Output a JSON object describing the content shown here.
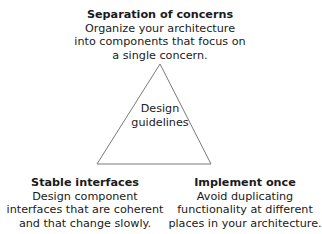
{
  "diagram": {
    "center": {
      "line1": "Design",
      "line2": "guidelines"
    },
    "top": {
      "title": "Separation of concerns",
      "lines": [
        "Organize your architecture",
        "into components that focus on",
        "a single concern."
      ]
    },
    "left": {
      "title": "Stable interfaces",
      "lines": [
        "Design component",
        "interfaces that are coherent",
        "and that change slowly."
      ]
    },
    "right": {
      "title": "Implement once",
      "lines": [
        "Avoid duplicating",
        "functionality at different",
        "places in your architecture."
      ]
    },
    "colors": {
      "stroke": "#7a7a7a",
      "text": "#1a1a1a"
    }
  }
}
